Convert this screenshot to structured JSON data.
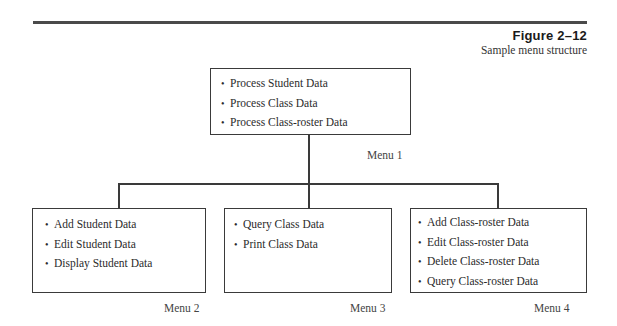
{
  "figure": {
    "number": "Figure 2–12",
    "caption": "Sample menu structure"
  },
  "menus": [
    {
      "label": "Menu 1",
      "items": [
        "Process Student Data",
        "Process Class Data",
        "Process Class-roster Data"
      ]
    },
    {
      "label": "Menu 2",
      "items": [
        "Add Student Data",
        "Edit Student Data",
        "Display Student Data"
      ]
    },
    {
      "label": "Menu 3",
      "items": [
        "Query Class Data",
        "Print Class Data"
      ]
    },
    {
      "label": "Menu 4",
      "items": [
        "Add Class-roster Data",
        "Edit Class-roster Data",
        "Delete Class-roster Data",
        "Query Class-roster Data"
      ]
    }
  ],
  "colors": {
    "line": "#3a3a3a",
    "text": "#2b2b2b",
    "rule": "#4a4a4a"
  }
}
